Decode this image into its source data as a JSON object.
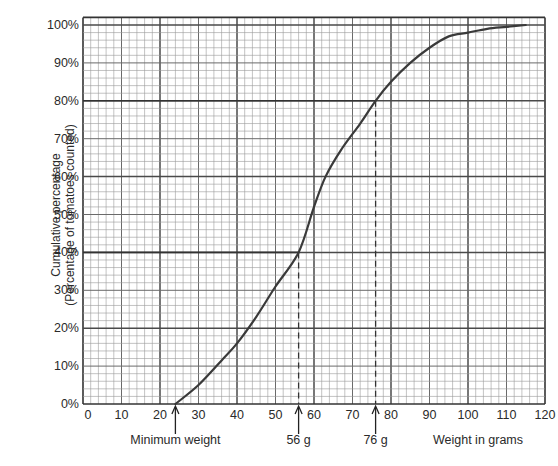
{
  "chart_data": {
    "type": "line",
    "title": "",
    "xlabel": "Weight in grams",
    "ylabel": [
      "Cumulative percentage",
      "(Percentage of tomatoes counted)"
    ],
    "xlim": [
      0,
      120
    ],
    "ylim": [
      0,
      100
    ],
    "grid": true,
    "x_ticks": [
      0,
      10,
      20,
      30,
      40,
      50,
      60,
      70,
      80,
      90,
      100,
      110,
      120
    ],
    "y_ticks": [
      0,
      10,
      20,
      30,
      40,
      50,
      60,
      70,
      80,
      90,
      100
    ],
    "y_tick_labels": [
      "0%",
      "10%",
      "20%",
      "30%",
      "40%",
      "50%",
      "60%",
      "70%",
      "80%",
      "90%",
      "100%"
    ],
    "series": [
      {
        "name": "Cumulative frequency curve",
        "color": "#3a3a3a",
        "x": [
          24,
          30,
          36,
          40,
          45,
          50,
          56,
          60,
          63,
          67,
          72,
          76,
          80,
          85,
          90,
          95,
          100,
          105,
          110,
          115
        ],
        "y": [
          0,
          5,
          11.5,
          16,
          23,
          31,
          40,
          52,
          60,
          67,
          74,
          80,
          85,
          90,
          94,
          97,
          98,
          99,
          99.5,
          100
        ]
      }
    ],
    "reference_lines": [
      {
        "x": 56,
        "y": 40,
        "style": "dashed"
      },
      {
        "x": 76,
        "y": 80,
        "style": "dashed"
      }
    ],
    "annotations": [
      {
        "x": 24,
        "label": "Minimum weight"
      },
      {
        "x": 56,
        "label": "56 g"
      },
      {
        "x": 76,
        "label": "76 g"
      }
    ]
  }
}
